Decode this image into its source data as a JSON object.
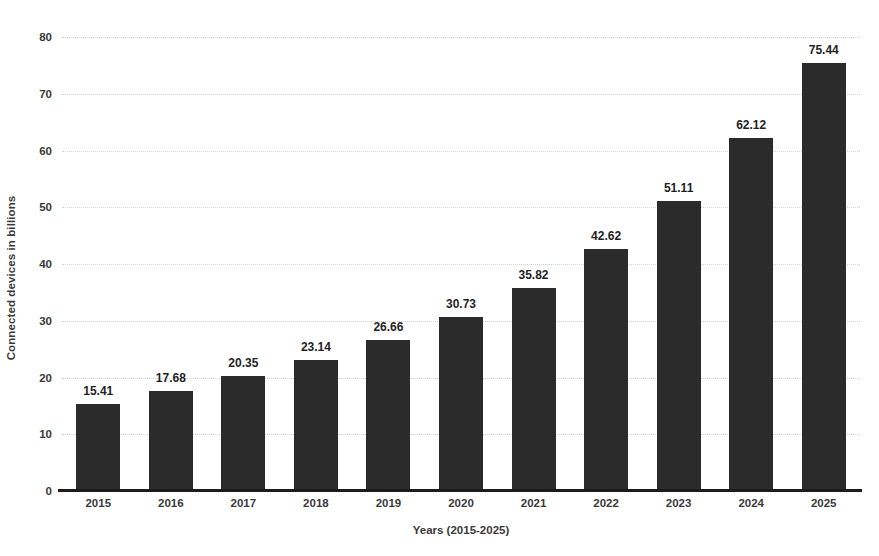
{
  "chart_data": {
    "type": "bar",
    "title": "",
    "xlabel": "Years (2015-2025)",
    "ylabel": "Connected devices in billions",
    "categories": [
      "2015",
      "2016",
      "2017",
      "2018",
      "2019",
      "2020",
      "2021",
      "2022",
      "2023",
      "2024",
      "2025"
    ],
    "values": [
      15.41,
      17.68,
      20.35,
      23.14,
      26.66,
      30.73,
      35.82,
      42.62,
      51.11,
      62.12,
      75.44
    ],
    "value_labels": [
      "15.41",
      "17.68",
      "20.35",
      "23.14",
      "26.66",
      "30.73",
      "35.82",
      "42.62",
      "51.11",
      "62.12",
      "75.44"
    ],
    "ylim": [
      0,
      80
    ],
    "yticks": [
      0,
      10,
      20,
      30,
      40,
      50,
      60,
      70,
      80
    ],
    "ytick_labels": [
      "0",
      "10",
      "20",
      "30",
      "40",
      "50",
      "60",
      "70",
      "80"
    ],
    "grid": true,
    "grid_style": "dotted",
    "legend": null,
    "bar_color": "#2b2b2b",
    "grid_color": "#d2d2d2",
    "axis_color": "#1c1c1c",
    "text_color": "#3a3a3a",
    "background": "#ffffff"
  }
}
